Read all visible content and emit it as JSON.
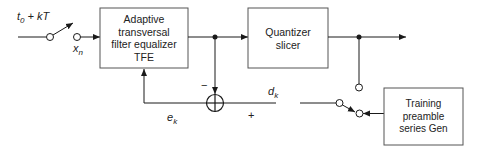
{
  "diagram": {
    "type": "block-diagram",
    "blocks": {
      "tfe": {
        "lines": [
          "Adaptive",
          "transversal",
          "filter equalizer",
          "TFE"
        ]
      },
      "quantizer": {
        "lines": [
          "Quantizer",
          "slicer"
        ]
      },
      "training": {
        "lines": [
          "Training",
          "preamble",
          "series Gen"
        ]
      }
    },
    "labels": {
      "sampler_main": "t",
      "sampler_sub": "0",
      "sampler_rest": " + kT",
      "xn_main": "x",
      "xn_sub": "n",
      "ek_main": "e",
      "ek_sub": "k",
      "dk_main": "d",
      "dk_sub": "k",
      "minus": "−",
      "plus": "+"
    },
    "colors": {
      "line": "#1a1a1a",
      "box_border": "#555555",
      "background": "#ffffff"
    }
  }
}
